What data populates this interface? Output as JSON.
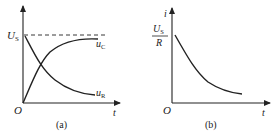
{
  "figure_a": {
    "caption": "(a)",
    "y_level_label": "U",
    "y_level_sub": "S",
    "origin_label": "O",
    "x_axis_label": "t",
    "curves": [
      {
        "name": "u",
        "sub": "C",
        "description": "rising exponential from 0 to U_S"
      },
      {
        "name": "u",
        "sub": "R",
        "description": "decaying exponential from U_S to 0"
      }
    ],
    "asymptote": "dashed line at U_S"
  },
  "figure_b": {
    "caption": "(b)",
    "y_axis_label": "i",
    "y_level_num": "U",
    "y_level_num_sub": "S",
    "y_level_den": "R",
    "origin_label": "O",
    "x_axis_label": "t",
    "curve": "decaying exponential from U_S/R toward 0"
  },
  "colors": {
    "line": "#222222",
    "background": "#ffffff"
  }
}
